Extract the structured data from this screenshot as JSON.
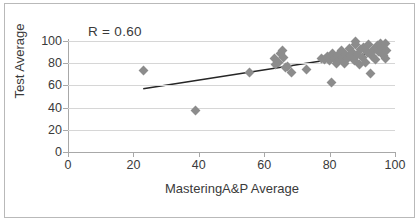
{
  "figure": {
    "annotation": "R = 0.60"
  },
  "chart_data": {
    "type": "scatter",
    "title": "",
    "xlabel": "MasteringA&P Average",
    "ylabel": "Test Average",
    "xlim": [
      0,
      100
    ],
    "ylim": [
      0,
      100
    ],
    "xticks": [
      0,
      20,
      40,
      60,
      80,
      100
    ],
    "yticks": [
      0,
      20,
      40,
      60,
      80,
      100
    ],
    "xtick_labels": [
      "0",
      "20",
      "40",
      "60",
      "80",
      "100"
    ],
    "ytick_labels": [
      "0",
      "20",
      "40",
      "60",
      "80",
      "100"
    ],
    "grid": "horizontal",
    "legend": "none",
    "annotations": [
      {
        "text": "R = 0.60",
        "x": 26,
        "y": 104
      }
    ],
    "marker": {
      "shape": "diamond",
      "color": "#8c8c8c",
      "size": 7
    },
    "series": [
      {
        "name": "Students",
        "points": [
          [
            23.0,
            73.5
          ],
          [
            39.0,
            37.5
          ],
          [
            55.5,
            72.0
          ],
          [
            63.0,
            84.0
          ],
          [
            63.5,
            79.0
          ],
          [
            64.5,
            80.5
          ],
          [
            65.0,
            88.5
          ],
          [
            65.5,
            91.0
          ],
          [
            66.0,
            85.0
          ],
          [
            66.5,
            76.5
          ],
          [
            67.0,
            77.0
          ],
          [
            68.5,
            71.5
          ],
          [
            73.0,
            74.5
          ],
          [
            77.5,
            84.0
          ],
          [
            78.5,
            83.5
          ],
          [
            79.5,
            86.0
          ],
          [
            80.0,
            82.5
          ],
          [
            80.5,
            63.0
          ],
          [
            81.0,
            89.0
          ],
          [
            81.5,
            84.5
          ],
          [
            82.0,
            80.0
          ],
          [
            82.5,
            86.5
          ],
          [
            83.0,
            83.0
          ],
          [
            83.5,
            91.5
          ],
          [
            84.0,
            85.5
          ],
          [
            84.5,
            79.5
          ],
          [
            85.0,
            88.0
          ],
          [
            85.5,
            84.0
          ],
          [
            86.0,
            93.0
          ],
          [
            86.5,
            86.5
          ],
          [
            87.0,
            90.0
          ],
          [
            87.5,
            82.0
          ],
          [
            88.0,
            96.5
          ],
          [
            88.0,
            100.0
          ],
          [
            88.5,
            87.5
          ],
          [
            89.0,
            78.5
          ],
          [
            89.5,
            92.0
          ],
          [
            90.0,
            85.0
          ],
          [
            90.5,
            94.5
          ],
          [
            91.0,
            81.0
          ],
          [
            91.5,
            89.5
          ],
          [
            92.0,
            97.0
          ],
          [
            92.5,
            71.0
          ],
          [
            93.0,
            86.0
          ],
          [
            93.5,
            92.5
          ],
          [
            94.0,
            83.0
          ],
          [
            94.5,
            96.0
          ],
          [
            95.0,
            90.5
          ],
          [
            95.5,
            98.0
          ],
          [
            96.0,
            94.0
          ],
          [
            96.5,
            87.0
          ],
          [
            97.0,
            97.5
          ],
          [
            97.0,
            84.0
          ],
          [
            97.5,
            91.0
          ]
        ]
      }
    ],
    "trendline": {
      "type": "linear",
      "color": "#262626",
      "x_start": 23.0,
      "y_start": 57.0,
      "x_end": 97.0,
      "y_end": 91.0,
      "r": 0.6
    }
  }
}
